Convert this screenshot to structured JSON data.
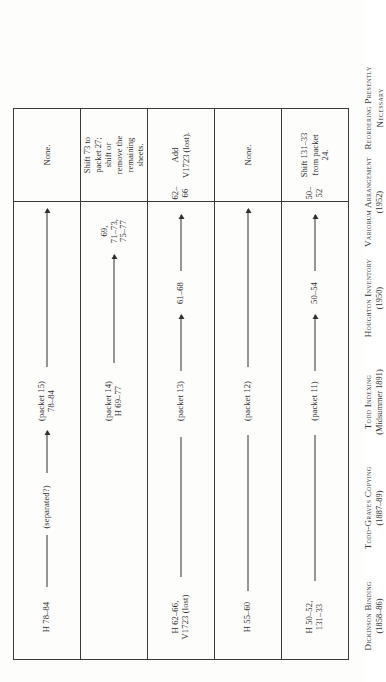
{
  "document": {
    "type": "scanned-table",
    "orientation": "rotated-90-ccw",
    "title_visible": false
  },
  "columns": [
    {
      "id": "dickinson-binding",
      "name": "Dickinson Binding",
      "date": "(1858–86)"
    },
    {
      "id": "todd-graves-copying",
      "name": "Todd-Graves Copying",
      "date": "(1887–89)"
    },
    {
      "id": "todd-indexing",
      "name": "Todd Indexing",
      "date": "(Midsummer 1891)"
    },
    {
      "id": "houghton-inventory",
      "name": "Houghton Inventory",
      "date": "(1950)"
    },
    {
      "id": "variorum-arrangement",
      "name": "Variorum Arrangement",
      "date": "(1952)"
    },
    {
      "id": "reordering",
      "name": "Reordering Presently",
      "date": "Necessary"
    }
  ],
  "rows": [
    {
      "id": "row-h-50-52",
      "binding": "H 50–52,\n131–33",
      "copying": "",
      "indexing": "(packet 11)",
      "inventory": "50–54",
      "variorum": "50–52",
      "action": "Shift 131–33\nfrom packet\n24."
    },
    {
      "id": "row-h-55-60",
      "binding": "H 55–60",
      "copying": "",
      "indexing": "(packet 12)",
      "inventory": "",
      "variorum": "",
      "action": "None."
    },
    {
      "id": "row-h-62-66",
      "binding": "H 62–66,\nV1723 (lost)",
      "copying": "",
      "indexing": "(packet 13)",
      "inventory": "61–68",
      "variorum": "62–66",
      "action": "Add\nV1723 (lost)."
    },
    {
      "id": "row-h-69-77",
      "binding": "",
      "copying": "",
      "indexing": "(packet 14)\nH 69–77",
      "inventory": "",
      "variorum": "69, 71–73,\n75–77",
      "action": "Shift 73 to\npacket 27;\nshift or\nremove the\nremaining\nsheets."
    },
    {
      "id": "row-h-78-84",
      "binding": "H 78–84",
      "copying": "(separated?)",
      "indexing": "(packet 15)\n78–84",
      "inventory": "",
      "variorum": "",
      "action": "None."
    }
  ],
  "colors": {
    "ink": "#2d2d2b",
    "rule": "#3a3a38",
    "paper": "#fdfdfc"
  }
}
